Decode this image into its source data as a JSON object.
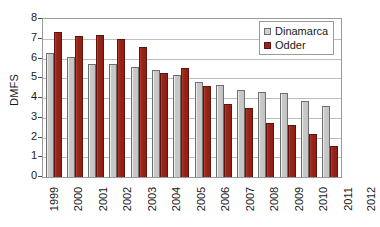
{
  "chart_data": {
    "type": "bar",
    "title": "",
    "xlabel": "",
    "ylabel": "DMFS",
    "ylim": [
      0,
      8
    ],
    "yticks": [
      0,
      1,
      2,
      3,
      4,
      5,
      6,
      7,
      8
    ],
    "grid": true,
    "legend_position": "top-right",
    "categories": [
      "1999",
      "2000",
      "2001",
      "2002",
      "2003",
      "2004",
      "2005",
      "2006",
      "2007",
      "2008",
      "2009",
      "2010",
      "2011",
      "2012"
    ],
    "series": [
      {
        "name": "Dinamarca",
        "color": "#c4c4c4",
        "values": [
          6.3,
          6.1,
          5.7,
          5.7,
          5.55,
          5.4,
          5.15,
          4.8,
          4.65,
          4.4,
          4.3,
          4.25,
          3.85,
          3.6
        ]
      },
      {
        "name": "Odder",
        "color": "#97251a",
        "values": [
          7.35,
          7.15,
          7.2,
          7.0,
          6.6,
          5.25,
          5.5,
          4.6,
          3.7,
          3.5,
          2.75,
          2.65,
          2.2,
          1.55
        ]
      }
    ]
  },
  "legend": {
    "items": [
      {
        "label": "Dinamarca",
        "swatch": "dinamarca"
      },
      {
        "label": "Odder",
        "swatch": "odder"
      }
    ]
  }
}
